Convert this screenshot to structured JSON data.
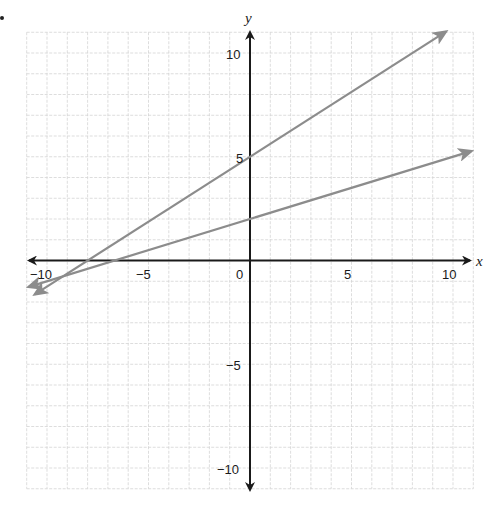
{
  "chart_data": {
    "type": "line",
    "title": "",
    "xlabel": "x",
    "ylabel": "y",
    "xlim": [
      -11,
      11
    ],
    "ylim": [
      -11,
      11
    ],
    "grid": true,
    "x_ticks": [
      -10,
      -5,
      0,
      5,
      10
    ],
    "y_ticks": [
      10,
      5,
      -5,
      -10
    ],
    "x_tick_labels": [
      "−10",
      "−5",
      "0",
      "5",
      "10"
    ],
    "y_tick_labels": [
      "10",
      "5",
      "−5",
      "−10"
    ],
    "series": [
      {
        "name": "line-1",
        "equation": "y = 0.625x + 5",
        "slope": 0.625,
        "intercept": 5,
        "x": [
          -10.6,
          9.65
        ],
        "y": [
          -1.63,
          11.03
        ],
        "color": "#8c8c8c",
        "arrows": "both"
      },
      {
        "name": "line-2",
        "equation": "y = 0.3x + 2",
        "slope": 0.3,
        "intercept": 2,
        "x": [
          -10.9,
          10.9
        ],
        "y": [
          -1.27,
          5.27
        ],
        "color": "#8c8c8c",
        "arrows": "both"
      }
    ],
    "legend": null
  },
  "colors": {
    "axis": "#1a1a1a",
    "grid": "#d4d4d4",
    "line": "#8c8c8c"
  },
  "labels": {
    "x_axis": "x",
    "y_axis": "y",
    "tick_x_neg10": "−10",
    "tick_x_neg5": "−5",
    "tick_x_0": "0",
    "tick_x_5": "5",
    "tick_x_10": "10",
    "tick_y_10": "10",
    "tick_y_5": "5",
    "tick_y_neg5": "−5",
    "tick_y_neg10": "−10"
  }
}
